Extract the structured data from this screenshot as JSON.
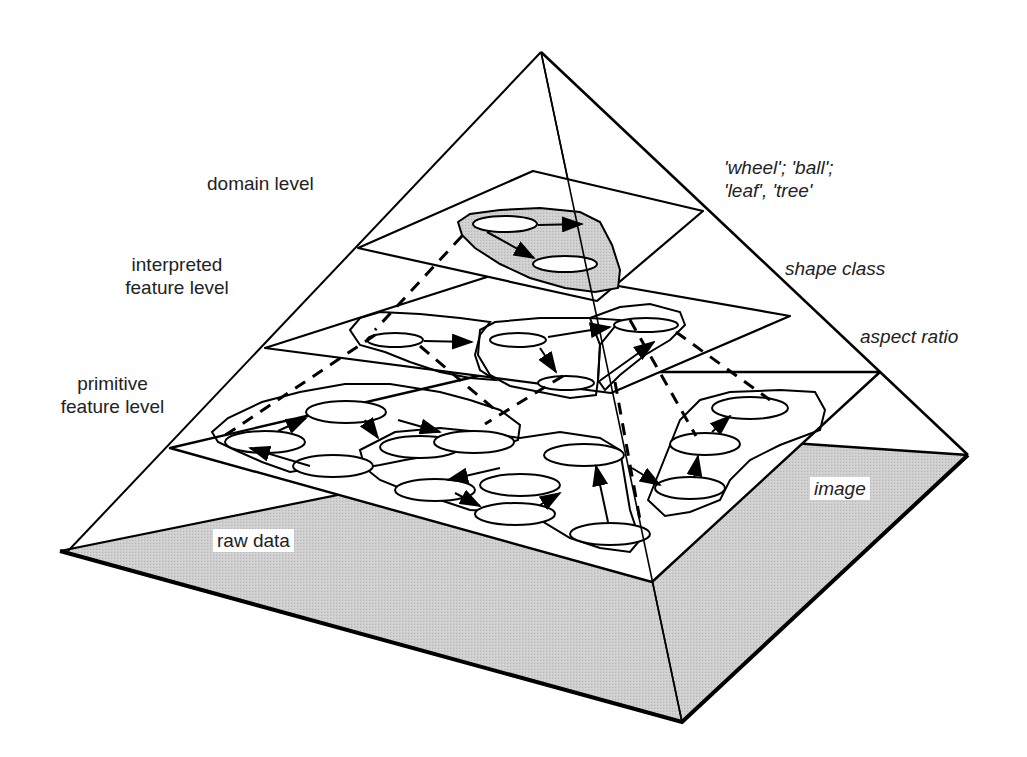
{
  "colors": {
    "line": "#000000",
    "base_fill": "#c8c8c8",
    "domain_region_fill": "#d6d6d6",
    "background": "#ffffff"
  },
  "labels": {
    "left": {
      "domain_level": "domain level",
      "interpreted_line1": "interpreted",
      "interpreted_line2": "feature level",
      "primitive_line1": "primitive",
      "primitive_line2": "feature level"
    },
    "right": {
      "domain_examples_line1": "'wheel'; 'ball';",
      "domain_examples_line2": "'leaf', 'tree'",
      "shape_class": "shape class",
      "aspect_ratio": "aspect ratio"
    },
    "base": {
      "raw_data": "raw data",
      "image": "image"
    }
  },
  "levels": [
    {
      "id": "domain",
      "name": "domain level",
      "example": "'wheel'; 'ball'; 'leaf', 'tree'"
    },
    {
      "id": "interpreted",
      "name": "interpreted feature level",
      "example": "shape class"
    },
    {
      "id": "primitive",
      "name": "primitive feature level",
      "example": "aspect ratio"
    },
    {
      "id": "raw",
      "name": "raw data",
      "example": "image"
    }
  ]
}
